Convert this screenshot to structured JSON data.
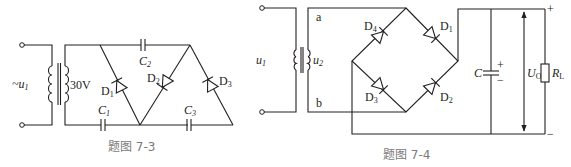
{
  "figures": [
    {
      "id": "fig-7-3",
      "caption": "题图 7-3",
      "input_label": "~u",
      "input_label_sub": "1",
      "transformer_secondary_voltage": "30V",
      "components": {
        "C1": {
          "label": "C",
          "sub": "1"
        },
        "C2": {
          "label": "C",
          "sub": "2"
        },
        "C3": {
          "label": "C",
          "sub": "3"
        },
        "D1": {
          "label": "D",
          "sub": "1"
        },
        "D2": {
          "label": "D",
          "sub": "2"
        },
        "D3": {
          "label": "D",
          "sub": "3"
        }
      }
    },
    {
      "id": "fig-7-4",
      "caption": "题图 7-4",
      "input_label": "u",
      "input_label_sub": "1",
      "secondary_label": "u",
      "secondary_label_sub": "2",
      "node_a": "a",
      "node_b": "b",
      "components": {
        "D1": {
          "label": "D",
          "sub": "1"
        },
        "D2": {
          "label": "D",
          "sub": "2"
        },
        "D3": {
          "label": "D",
          "sub": "3"
        },
        "D4": {
          "label": "D",
          "sub": "4"
        },
        "C": {
          "label": "C",
          "plus": "+",
          "minus": "−"
        },
        "RL": {
          "label": "R",
          "sub": "L"
        }
      },
      "output_label": "U",
      "output_label_sub": "O",
      "output_plus": "+",
      "output_minus": "−"
    }
  ]
}
